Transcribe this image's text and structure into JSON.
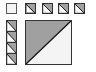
{
  "diagram": {
    "colors": {
      "fill": "#a0a0a0",
      "stroke": "#333333",
      "background": "#ffffff",
      "light": "#f4f4f4"
    },
    "top_row": [
      {
        "x": 6,
        "y": 3,
        "size": 10,
        "split": "none"
      },
      {
        "x": 25,
        "y": 3,
        "size": 10,
        "split": "diag"
      },
      {
        "x": 42,
        "y": 3,
        "size": 10,
        "split": "diag"
      },
      {
        "x": 58,
        "y": 3,
        "size": 10,
        "split": "diag"
      },
      {
        "x": 74,
        "y": 3,
        "size": 10,
        "split": "diag"
      }
    ],
    "left_column": {
      "x": 6,
      "y": 20,
      "width": 10,
      "height": 45,
      "cells": 4
    },
    "big_square": {
      "x": 25,
      "y": 20,
      "size": 46,
      "split": "anti-diag"
    }
  }
}
